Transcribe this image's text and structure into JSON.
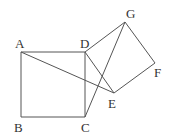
{
  "diagram": {
    "points": {
      "A": {
        "label": "A",
        "x": 21,
        "y": 52,
        "lx": 15,
        "ly": 48
      },
      "B": {
        "label": "B",
        "x": 21,
        "y": 117,
        "lx": 14,
        "ly": 132
      },
      "C": {
        "label": "C",
        "x": 85,
        "y": 117,
        "lx": 81,
        "ly": 132
      },
      "D": {
        "label": "D",
        "x": 85,
        "y": 52,
        "lx": 80,
        "ly": 48
      },
      "E": {
        "label": "E",
        "x": 114,
        "y": 93,
        "lx": 108,
        "ly": 108
      },
      "F": {
        "label": "F",
        "x": 155,
        "y": 63,
        "lx": 154,
        "ly": 77
      },
      "G": {
        "label": "G",
        "x": 125,
        "y": 22,
        "lx": 126,
        "ly": 18
      }
    },
    "segments": [
      [
        "A",
        "B"
      ],
      [
        "B",
        "C"
      ],
      [
        "C",
        "D"
      ],
      [
        "D",
        "A"
      ],
      [
        "D",
        "E"
      ],
      [
        "E",
        "F"
      ],
      [
        "F",
        "G"
      ],
      [
        "G",
        "D"
      ],
      [
        "A",
        "E"
      ],
      [
        "C",
        "G"
      ]
    ],
    "stroke_color": "#555555"
  }
}
